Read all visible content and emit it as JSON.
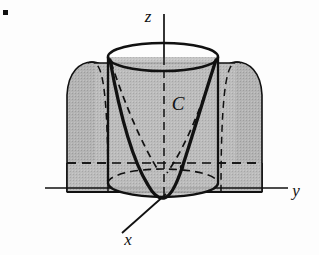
{
  "figure": {
    "kind": "3d-math-diagram",
    "background_color": "#fdfdfd",
    "ink_color": "#111111",
    "shade_fill": "#b0b0b0",
    "shade_fill_light": "#b8b8b8",
    "bullet_marker": {
      "name": "corner-dot",
      "x": 3,
      "y": 10,
      "size": 5,
      "color": "#111111"
    },
    "axes": [
      {
        "name": "z",
        "label": "z",
        "label_x": 148,
        "label_y": 22,
        "x1": 164,
        "y1": 14,
        "x2": 164,
        "y2": 200
      },
      {
        "name": "y",
        "label": "y",
        "label_x": 296,
        "label_y": 196,
        "x1": 45,
        "y1": 188,
        "x2": 288,
        "y2": 188
      },
      {
        "name": "x",
        "label": "x",
        "label_x": 128,
        "label_y": 245,
        "x1": 163,
        "y1": 197,
        "x2": 122,
        "y2": 233
      }
    ],
    "cylinder": {
      "name": "circular-cylinder",
      "center_x": 163,
      "top_y": 57,
      "bottom_y": 183,
      "rx": 55,
      "ry": 14,
      "left_x": 108,
      "right_x": 218
    },
    "parabolic_sheet": {
      "name": "parabolic-cylinder-surface",
      "left_edge_x": 67,
      "right_edge_x": 262,
      "crest_y": 63,
      "base_y": 192,
      "back_plane_y": 163
    },
    "curve": {
      "name": "intersection-curve-C",
      "label": "C",
      "label_x": 178,
      "label_y": 110,
      "stroke_width": 3.2
    }
  }
}
